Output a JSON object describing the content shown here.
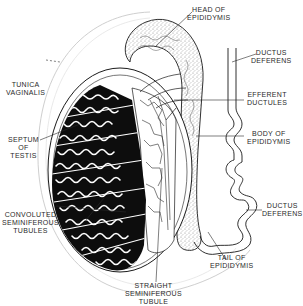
{
  "diagram": {
    "colors": {
      "ink": "#1a1a1a",
      "tubule_fill": "#0d0d0d",
      "tubule_lumen": "#ffffff",
      "stipple": "#9a9a9a",
      "faint_line": "#c8c8c8",
      "background": "#ffffff"
    },
    "labels": [
      {
        "id": "head-of-epididymis",
        "lines": [
          "HEAD OF",
          "EPIDIDYMIS"
        ]
      },
      {
        "id": "ductus-deferens-top",
        "lines": [
          "DUCTUS",
          "DEFERENS"
        ]
      },
      {
        "id": "tunica-vaginalis",
        "lines": [
          "TUNICA",
          "VAGINALIS"
        ]
      },
      {
        "id": "efferent-ductules",
        "lines": [
          "EFFERENT",
          "DUCTULES"
        ]
      },
      {
        "id": "septum-of-testis",
        "lines": [
          "SEPTUM",
          "OF",
          "TESTIS"
        ]
      },
      {
        "id": "body-of-epididymis",
        "lines": [
          "BODY OF",
          "EPIDIDYMIS"
        ]
      },
      {
        "id": "convoluted-seminiferous-tubules",
        "lines": [
          "CONVOLUTED",
          "SEMINIFEROUS",
          "TUBULES"
        ]
      },
      {
        "id": "ductus-deferens-bottom",
        "lines": [
          "DUCTUS",
          "DEFERENS"
        ]
      },
      {
        "id": "tail-of-epididymis",
        "lines": [
          "TAIL OF",
          "EPIDIDYMIS"
        ]
      },
      {
        "id": "straight-seminiferous-tubule",
        "lines": [
          "STRAIGHT",
          "SEMINIFEROUS",
          "TUBULE"
        ]
      }
    ]
  }
}
